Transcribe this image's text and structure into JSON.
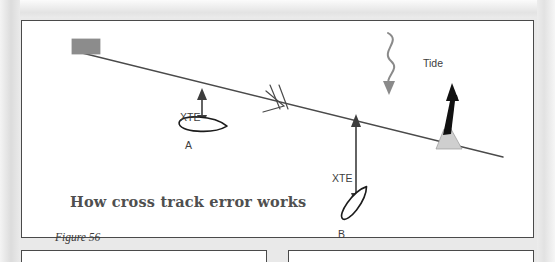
{
  "page": {
    "background_color": "#e9e9e9",
    "paper_color": "#ffffff",
    "border_color": "#4a4a4a"
  },
  "figure": {
    "title": "How cross track error works",
    "title_color": "#4f4f4f",
    "caption": "Figure 56",
    "caption_color": "#3a3a3a"
  },
  "diagram": {
    "ink_color": "#3d3d3d",
    "labels": {
      "tide": "Tide",
      "xte_a": "XTE",
      "xte_b": "XTE",
      "boat_a": "A",
      "boat_b": "B"
    },
    "elements": {
      "waypoint_marker": "waypoint-rectangle",
      "track_line": "intended-track-line",
      "course_tick": "double-tick-course-marker",
      "beacon": "navigation-beacon",
      "tide_arrow": "wavy-tide-arrow",
      "boat_a": "vessel-a-hull",
      "boat_b": "vessel-b-hull",
      "xte_arrow_a": "xte-measure-arrow-a",
      "xte_arrow_b": "xte-measure-arrow-b"
    },
    "colors": {
      "waypoint_fill": "#8c8c8c",
      "beacon_fill": "#111111",
      "beacon_base_fill": "#cfcfcf",
      "tide_arrow": "#8a8a8a",
      "line": "#4a4a4a"
    }
  },
  "lower_section": {
    "left_box": "continuation-box-left",
    "right_box": "continuation-box-right"
  }
}
